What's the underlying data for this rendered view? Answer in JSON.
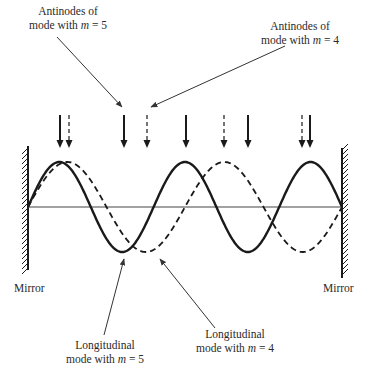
{
  "figure": {
    "labels": {
      "antinodes_m5_line1": "Antinodes of",
      "antinodes_m5_line2": "mode with ",
      "antinodes_m5_var": "m",
      "antinodes_m5_eq": " = 5",
      "antinodes_m4_line1": "Antinodes of",
      "antinodes_m4_line2": "mode with ",
      "antinodes_m4_var": "m",
      "antinodes_m4_eq": " = 4",
      "mode_m5_line1": "Longitudinal",
      "mode_m5_line2": "mode with ",
      "mode_m5_var": "m",
      "mode_m5_eq": " = 5",
      "mode_m4_line1": "Longitudinal",
      "mode_m4_line2": "mode with ",
      "mode_m4_var": "m",
      "mode_m4_eq": " = 4",
      "mirror_left": "Mirror",
      "mirror_right": "Mirror"
    },
    "modes": [
      {
        "name": "m=5",
        "m": 5,
        "style": "solid",
        "half_wavelengths": 5
      },
      {
        "name": "m=4",
        "m": 4,
        "style": "dashed",
        "half_wavelengths": 4
      }
    ],
    "antinode_arrows": {
      "solid_m5_x": [
        60,
        124,
        186,
        248,
        310
      ],
      "dashed_m4_x": [
        69,
        147,
        224,
        302
      ]
    },
    "colors": {
      "ink": "#1a1a1a",
      "thin_line": "#444444",
      "background": "#ffffff"
    }
  }
}
